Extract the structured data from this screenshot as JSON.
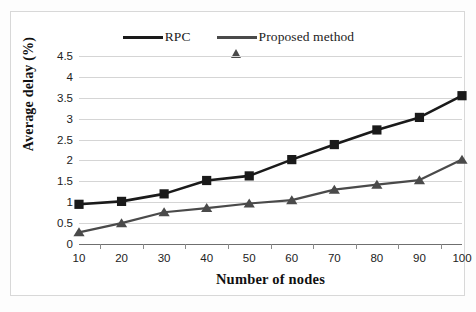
{
  "chart_data": {
    "type": "line",
    "title": "",
    "xlabel": "Number of nodes",
    "ylabel": "Average delay (%)",
    "x": [
      10,
      20,
      30,
      40,
      50,
      60,
      70,
      80,
      90,
      100
    ],
    "categories": [
      "10",
      "20",
      "30",
      "40",
      "50",
      "60",
      "70",
      "80",
      "90",
      "100"
    ],
    "xlim": [
      10,
      100
    ],
    "ylim": [
      0,
      4.5
    ],
    "yticks": [
      0,
      0.5,
      1,
      1.5,
      2,
      2.5,
      3,
      3.5,
      4,
      4.5
    ],
    "ytick_labels": [
      "0",
      "0.5",
      "1",
      "1.5",
      "2",
      "2.5",
      "3",
      "3.5",
      "4",
      "4.5"
    ],
    "grid": true,
    "grid_axis": "y",
    "legend_position": "top-center",
    "series": [
      {
        "name": "RPC",
        "marker": "square",
        "color": "#1a1a1a",
        "values": [
          0.95,
          1.02,
          1.2,
          1.52,
          1.63,
          2.02,
          2.38,
          2.73,
          3.03,
          3.55
        ]
      },
      {
        "name": "Proposed method",
        "marker": "triangle",
        "color": "#4a4a4a",
        "values": [
          0.28,
          0.5,
          0.76,
          0.86,
          0.97,
          1.05,
          1.3,
          1.42,
          1.53,
          2.02
        ]
      }
    ]
  },
  "legend": {
    "entries": [
      {
        "label": "RPC",
        "marker": "square-marker-icon"
      },
      {
        "label": "Proposed method",
        "marker": "triangle-marker-icon"
      }
    ]
  },
  "axes": {
    "x_title": "Number of nodes",
    "y_title": "Average delay (%)"
  },
  "colors": {
    "series_rpc": "#1a1a1a",
    "series_proposed": "#4a4a4a",
    "gridline": "#d5d5d5",
    "axis": "#6f6f6f",
    "frame": "#d8d8d8",
    "background": "#ffffff"
  }
}
